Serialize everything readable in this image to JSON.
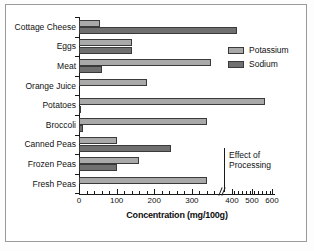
{
  "chart_data": {
    "type": "bar",
    "orientation": "horizontal",
    "title": "",
    "xlabel": "Concentration (mg/100g)",
    "ylabel": "",
    "categories": [
      "Cottage Cheese",
      "Eggs",
      "Meat",
      "Orange Juice",
      "Potatoes",
      "Broccoli",
      "Canned Peas",
      "Frozen Peas",
      "Fresh Peas"
    ],
    "series": [
      {
        "name": "Potassium",
        "color": "#a9a9a9",
        "values": [
          55,
          140,
          350,
          180,
          565,
          340,
          100,
          160,
          340
        ]
      },
      {
        "name": "Sodium",
        "color": "#707070",
        "values": [
          425,
          140,
          60,
          0,
          5,
          10,
          245,
          100,
          0
        ]
      }
    ],
    "xlim": [
      0,
      600
    ],
    "xticks": [
      0,
      100,
      200,
      300,
      400,
      500,
      600
    ],
    "xtick_labels": [
      "0",
      "100",
      "200",
      "300",
      "400",
      "500",
      "600"
    ],
    "axis_break": {
      "present": true,
      "after_value": 380,
      "note": "scale compressed between 400 and 600"
    },
    "grid": false,
    "legend_position": "upper right",
    "annotations": [
      {
        "text_line1": "Effect of",
        "text_line2": "Processing",
        "bracket": true,
        "covers": [
          "Canned Peas",
          "Frozen Peas",
          "Fresh Peas"
        ]
      }
    ]
  },
  "legend": {
    "entries": [
      {
        "label": "Potassium",
        "color": "#a9a9a9"
      },
      {
        "label": "Sodium",
        "color": "#707070"
      }
    ]
  },
  "annotation": {
    "line1": "Effect of",
    "line2": "Processing"
  },
  "axis": {
    "x_title": "Concentration (mg/100g)"
  }
}
